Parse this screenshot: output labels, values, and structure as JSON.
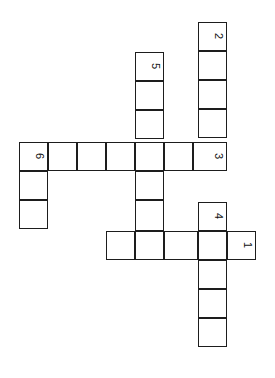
{
  "puzzle": {
    "kind": "crossword-grid",
    "title": "Crossword puzzle grid",
    "orientation": "rotated-90",
    "cell_size": 29,
    "background_color": "#ffffff",
    "cell_fill_color": "#ffffff",
    "line_color": "#1d1d1d",
    "number_color": "#111111",
    "columns": 9,
    "rows": 13,
    "cells": [
      {
        "x": 198,
        "y": 22,
        "w": 29,
        "h": 29
      },
      {
        "x": 198,
        "y": 51,
        "w": 29,
        "h": 29
      },
      {
        "x": 198,
        "y": 80,
        "w": 29,
        "h": 29
      },
      {
        "x": 198,
        "y": 109,
        "w": 29,
        "h": 29
      },
      {
        "x": 135,
        "y": 52,
        "w": 29,
        "h": 29
      },
      {
        "x": 135,
        "y": 81,
        "w": 29,
        "h": 29
      },
      {
        "x": 135,
        "y": 110,
        "w": 29,
        "h": 29
      },
      {
        "x": 19,
        "y": 142,
        "w": 29,
        "h": 29
      },
      {
        "x": 48,
        "y": 142,
        "w": 29,
        "h": 29
      },
      {
        "x": 77,
        "y": 142,
        "w": 29,
        "h": 29
      },
      {
        "x": 106,
        "y": 142,
        "w": 29,
        "h": 29
      },
      {
        "x": 135,
        "y": 142,
        "w": 29,
        "h": 29
      },
      {
        "x": 164,
        "y": 142,
        "w": 29,
        "h": 29
      },
      {
        "x": 193,
        "y": 142,
        "w": 34,
        "h": 29
      },
      {
        "x": 19,
        "y": 171,
        "w": 29,
        "h": 29
      },
      {
        "x": 19,
        "y": 200,
        "w": 29,
        "h": 29
      },
      {
        "x": 135,
        "y": 171,
        "w": 29,
        "h": 29
      },
      {
        "x": 135,
        "y": 200,
        "w": 29,
        "h": 31
      },
      {
        "x": 198,
        "y": 202,
        "w": 29,
        "h": 29
      },
      {
        "x": 106,
        "y": 231,
        "w": 29,
        "h": 29
      },
      {
        "x": 135,
        "y": 231,
        "w": 29,
        "h": 29
      },
      {
        "x": 164,
        "y": 231,
        "w": 34,
        "h": 29
      },
      {
        "x": 198,
        "y": 231,
        "w": 29,
        "h": 29
      },
      {
        "x": 227,
        "y": 231,
        "w": 29,
        "h": 29
      },
      {
        "x": 198,
        "y": 260,
        "w": 29,
        "h": 29
      },
      {
        "x": 198,
        "y": 289,
        "w": 29,
        "h": 29
      },
      {
        "x": 198,
        "y": 318,
        "w": 29,
        "h": 29
      }
    ],
    "numbers": [
      {
        "label": "2",
        "x": 212,
        "y": 30
      },
      {
        "label": "5",
        "x": 149,
        "y": 60
      },
      {
        "label": "3",
        "x": 212,
        "y": 150
      },
      {
        "label": "6",
        "x": 33,
        "y": 150
      },
      {
        "label": "4",
        "x": 212,
        "y": 210
      },
      {
        "label": "1",
        "x": 241,
        "y": 239
      }
    ],
    "entries": [
      {
        "number": "1",
        "direction": "down-on-page",
        "length": 5
      },
      {
        "number": "2",
        "direction": "across-on-page",
        "length": 5
      },
      {
        "number": "3",
        "direction": "down-on-page",
        "length": 7
      },
      {
        "number": "4",
        "direction": "across-on-page",
        "length": 4
      },
      {
        "number": "5",
        "direction": "across-on-page",
        "length": 7
      },
      {
        "number": "6",
        "direction": "down-on-page",
        "length": 3
      }
    ]
  }
}
